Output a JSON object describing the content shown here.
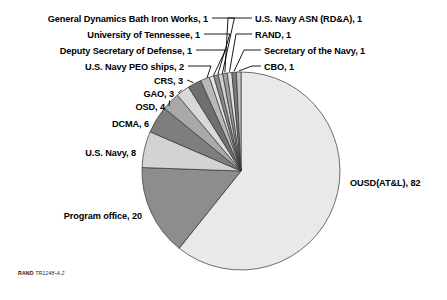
{
  "figure": {
    "credit_prefix": "RAND",
    "credit_id": "TR1248-A.2"
  },
  "chart_data": {
    "type": "pie",
    "title": "",
    "xlabel": "",
    "ylabel": "",
    "total": 135,
    "start_angle_deg": 0,
    "direction": "clockwise",
    "legend": "none",
    "labels_style": "outside-with-leader-lines",
    "categories": [
      "OUSD(AT&L)",
      "Program office",
      "U.S. Navy",
      "DCMA",
      "OSD",
      "GAO",
      "CRS",
      "U.S. Navy PEO ships",
      "Deputy Secretary of Defense",
      "University of Tennessee",
      "General Dynamics Bath Iron Works",
      "U.S. Navy ASN (RD&A)",
      "RAND",
      "Secretary of the Navy",
      "CBO"
    ],
    "values": [
      82,
      20,
      8,
      6,
      4,
      3,
      3,
      2,
      1,
      1,
      1,
      1,
      1,
      1,
      1
    ],
    "slice_labels": [
      "OUSD(AT&L), 82",
      "Program office, 20",
      "U.S. Navy, 8",
      "DCMA, 6",
      "OSD, 4",
      "GAO, 3",
      "CRS, 3",
      "U.S. Navy PEO ships, 2",
      "Deputy Secretary of Defense, 1",
      "University of Tennessee, 1",
      "General Dynamics Bath Iron Works, 1",
      "U.S. Navy ASN (RD&A), 1",
      "RAND, 1",
      "Secretary of the Navy, 1",
      "CBO, 1"
    ],
    "colors": [
      "#e9e9e7",
      "#8d8d8d",
      "#d3d3d1",
      "#7e7e7e",
      "#a9a9a7",
      "#d8d8d6",
      "#6f6f6f",
      "#b8b8b6",
      "#e4e4e2",
      "#8a8a8a",
      "#cfcfcd",
      "#9d9d9b",
      "#e0e0de",
      "#7a7a7a",
      "#c4c4c2"
    ],
    "stroke": "#333333"
  }
}
